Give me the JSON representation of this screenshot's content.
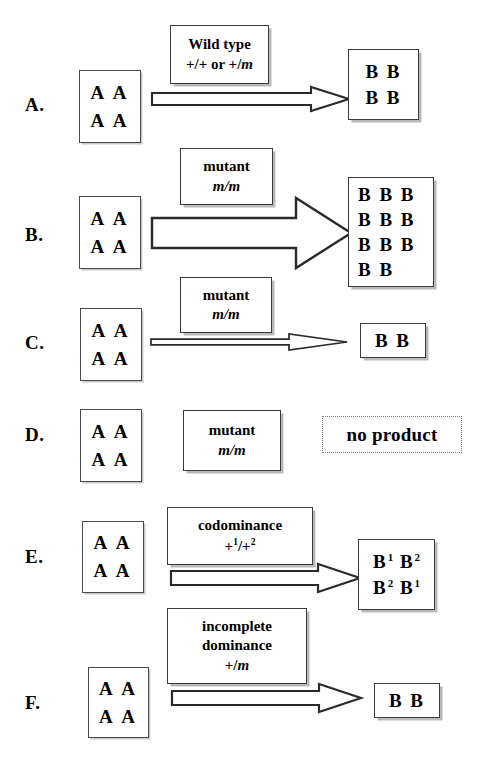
{
  "figure": {
    "background": "#ffffff",
    "line_color": "#3a3a3a",
    "shadow_color": "#b9b9b9"
  },
  "rows": [
    {
      "letter": "A.",
      "gene_box": {
        "lines": [
          "A A",
          "A A"
        ]
      },
      "label_box": {
        "lines": [
          "Wild type",
          "+/+ or +/m"
        ],
        "italic_tail": "m"
      },
      "arrow": {
        "kind": "medium",
        "present": true
      },
      "product_box": {
        "lines": [
          "B B",
          "B B"
        ],
        "kind": "solid"
      }
    },
    {
      "letter": "B.",
      "gene_box": {
        "lines": [
          "A A",
          "A A"
        ]
      },
      "label_box": {
        "lines": [
          "mutant",
          "m/m"
        ],
        "italic_line": 1
      },
      "arrow": {
        "kind": "thick",
        "present": true
      },
      "product_box": {
        "lines": [
          "B B B",
          "B B B",
          "B B B",
          "B B"
        ],
        "kind": "solid"
      }
    },
    {
      "letter": "C.",
      "gene_box": {
        "lines": [
          "A A",
          "A A"
        ]
      },
      "label_box": {
        "lines": [
          "mutant",
          "m/m"
        ],
        "italic_line": 1
      },
      "arrow": {
        "kind": "thin",
        "present": true
      },
      "product_box": {
        "lines": [
          "B B"
        ],
        "kind": "solid"
      }
    },
    {
      "letter": "D.",
      "gene_box": {
        "lines": [
          "A A",
          "A A"
        ]
      },
      "label_box": {
        "lines": [
          "mutant",
          "m/m"
        ],
        "italic_line": 1
      },
      "arrow": {
        "kind": "none",
        "present": false
      },
      "product_box": {
        "lines": [
          "no product"
        ],
        "kind": "dotted"
      }
    },
    {
      "letter": "E.",
      "gene_box": {
        "lines": [
          "A A",
          "A A"
        ]
      },
      "label_box": {
        "lines": [
          "codominance",
          "+1/+2"
        ],
        "superscripts": [
          1,
          2
        ]
      },
      "arrow": {
        "kind": "medium",
        "present": true
      },
      "product_box": {
        "lines": [
          "B1 B2",
          "B2 B1"
        ],
        "kind": "solid",
        "superscript": true
      }
    },
    {
      "letter": "F.",
      "gene_box": {
        "lines": [
          "A A",
          "A A"
        ]
      },
      "label_box": {
        "lines": [
          "incomplete",
          "dominance",
          "+/m"
        ],
        "italic_tail": "m"
      },
      "arrow": {
        "kind": "medium",
        "present": true
      },
      "product_box": {
        "lines": [
          "B B"
        ],
        "kind": "solid"
      }
    }
  ]
}
